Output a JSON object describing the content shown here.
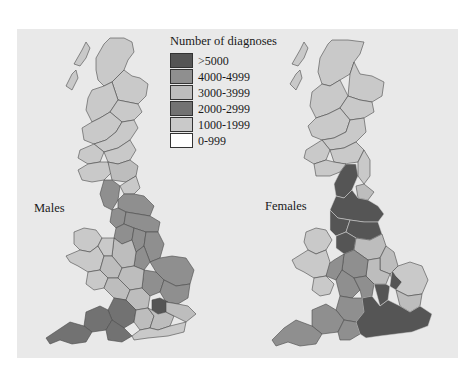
{
  "legend": {
    "title": "Number of diagnoses",
    "items": [
      {
        "label": ">5000",
        "color": "#555555"
      },
      {
        "label": "4000-4999",
        "color": "#8f8f8f"
      },
      {
        "label": "3000-3999",
        "color": "#bdbdbd"
      },
      {
        "label": "2000-2999",
        "color": "#727272"
      },
      {
        "label": "1000-1999",
        "color": "#c9c9c9"
      },
      {
        "label": "0-999",
        "color": "#ffffff"
      }
    ]
  },
  "maps": [
    {
      "label": "Males"
    },
    {
      "label": "Females"
    }
  ],
  "colors": {
    "panel_bg": "#e9e9e9",
    "c_gt5000": "#555555",
    "c_4000": "#8f8f8f",
    "c_3000": "#bdbdbd",
    "c_2000": "#727272",
    "c_1000": "#c9c9c9"
  }
}
